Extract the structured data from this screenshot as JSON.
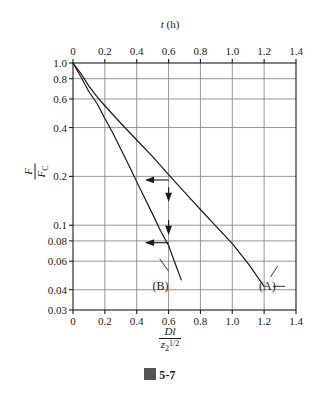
{
  "figure": {
    "caption_glyph": "图",
    "caption_text": "5-7"
  },
  "chart_data": {
    "type": "line",
    "title": "",
    "subtitle": "",
    "xlabel": "Dl / z2^(1/2)",
    "xlabel_numerator": "Dl",
    "xlabel_denominator": "z",
    "xlabel_den_sub": "2",
    "xlabel_den_sup": "1/2",
    "ylabel": "F / F_C",
    "ylabel_numerator": "F",
    "ylabel_denominator": "F",
    "ylabel_den_sub": "C",
    "top_axis_label": "t (h)",
    "top_axis_symbol": "t",
    "top_axis_unit": "(h)",
    "grid": true,
    "legend_position": "inline-annotation",
    "yscale": "log",
    "xscale": "linear",
    "xlim": [
      0,
      1.4
    ],
    "ylim": [
      0.03,
      1.0
    ],
    "xticks": [
      "0",
      "0.2",
      "0.4",
      "0.6",
      "0.8",
      "1.0",
      "1.2",
      "1.4"
    ],
    "xtick_values": [
      0,
      0.2,
      0.4,
      0.6,
      0.8,
      1.0,
      1.2,
      1.4
    ],
    "top_xticks": [
      "0",
      "0.2",
      "0.4",
      "0.6",
      "0.8",
      "1.0",
      "1.2",
      "1.4"
    ],
    "top_xtick_values": [
      0,
      0.2,
      0.4,
      0.6,
      0.8,
      1.0,
      1.2,
      1.4
    ],
    "yticks": [
      "1.0",
      "0.8",
      "0.6",
      "0.4",
      "0.2",
      "0.1",
      "0.08",
      "0.06",
      "0.04",
      "0.03"
    ],
    "ytick_values": [
      1.0,
      0.8,
      0.6,
      0.4,
      0.2,
      0.1,
      0.08,
      0.06,
      0.04,
      0.03
    ],
    "series": [
      {
        "name": "(A)",
        "label": "(A)",
        "label_x": 1.22,
        "label_y": 0.042,
        "x": [
          0.0,
          0.05,
          0.1,
          0.15,
          0.2,
          0.3,
          0.4,
          0.5,
          0.6,
          0.7,
          0.8,
          0.9,
          1.0,
          1.1,
          1.2
        ],
        "y": [
          1.0,
          0.86,
          0.72,
          0.62,
          0.545,
          0.425,
          0.335,
          0.265,
          0.205,
          0.16,
          0.125,
          0.098,
          0.077,
          0.058,
          0.042
        ]
      },
      {
        "name": "(B)",
        "label": "(B)",
        "label_x": 0.55,
        "label_y": 0.042,
        "x": [
          0.0,
          0.05,
          0.1,
          0.15,
          0.2,
          0.25,
          0.3,
          0.35,
          0.4,
          0.45,
          0.5,
          0.55,
          0.6,
          0.65,
          0.68
        ],
        "y": [
          1.0,
          0.82,
          0.665,
          0.565,
          0.455,
          0.37,
          0.295,
          0.235,
          0.185,
          0.147,
          0.117,
          0.092,
          0.075,
          0.055,
          0.046
        ]
      }
    ],
    "annotations": [
      {
        "name": "arrow-left-to-curve-a",
        "direction": "left",
        "x": 0.6,
        "y": 0.19
      },
      {
        "name": "arrow-down-to-curve-b-upper",
        "direction": "down",
        "x": 0.6,
        "y": 0.155
      },
      {
        "name": "arrow-down-to-curve-b-lower",
        "direction": "down",
        "x": 0.6,
        "y": 0.097
      },
      {
        "name": "arrow-left-to-curve-b",
        "direction": "left",
        "x": 0.6,
        "y": 0.078
      }
    ]
  }
}
